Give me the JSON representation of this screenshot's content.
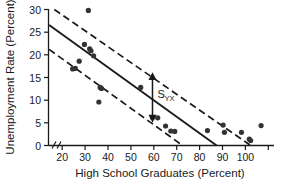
{
  "chart_data": {
    "type": "scatter",
    "title": "",
    "xlabel": "High School Graduates (Percent)",
    "ylabel": "Unemployment Rate (Percent)",
    "xlim": [
      15,
      100
    ],
    "ylim": [
      0,
      30
    ],
    "xticks": [
      20,
      30,
      40,
      50,
      60,
      70,
      80,
      90,
      100
    ],
    "yticks": [
      0,
      5,
      10,
      15,
      20,
      25,
      30
    ],
    "grid": false,
    "legend": null,
    "axis_break": true,
    "points": [
      {
        "x": 24.0,
        "y": 16.9
      },
      {
        "x": 25.0,
        "y": 17.0
      },
      {
        "x": 26.5,
        "y": 18.6
      },
      {
        "x": 28.5,
        "y": 22.3
      },
      {
        "x": 30.0,
        "y": 29.8
      },
      {
        "x": 30.5,
        "y": 21.3
      },
      {
        "x": 31.0,
        "y": 20.9
      },
      {
        "x": 32.0,
        "y": 19.8
      },
      {
        "x": 34.0,
        "y": 9.6
      },
      {
        "x": 34.5,
        "y": 12.8
      },
      {
        "x": 35.0,
        "y": 12.6
      },
      {
        "x": 50.0,
        "y": 12.8
      },
      {
        "x": 54.5,
        "y": 6.2
      },
      {
        "x": 56.5,
        "y": 6.1
      },
      {
        "x": 59.5,
        "y": 4.3
      },
      {
        "x": 61.5,
        "y": 3.2
      },
      {
        "x": 63.0,
        "y": 3.1
      },
      {
        "x": 75.5,
        "y": 3.3
      },
      {
        "x": 81.5,
        "y": 4.5
      },
      {
        "x": 82.0,
        "y": 2.9
      },
      {
        "x": 88.5,
        "y": 2.9
      },
      {
        "x": 91.5,
        "y": 1.4
      },
      {
        "x": 92.0,
        "y": 1.1
      },
      {
        "x": 96.0,
        "y": 4.4
      }
    ],
    "lines": [
      {
        "name": "regression-line",
        "style": "solid",
        "points": [
          [
            15,
            26.6
          ],
          [
            79,
            0
          ]
        ]
      },
      {
        "name": "upper-band-line",
        "style": "dashed",
        "points": [
          [
            17,
            30
          ],
          [
            92,
            0
          ]
        ]
      },
      {
        "name": "lower-band-line",
        "style": "dashed",
        "points": [
          [
            15,
            21.2
          ],
          [
            66,
            0
          ]
        ]
      }
    ],
    "annotations": [
      {
        "name": "syx-annotation",
        "label_main": "S",
        "label_sub": "YX",
        "type": "double-arrow",
        "x": 54.5,
        "y_top": 15.8,
        "y_bottom": 5.4
      }
    ],
    "colors": {
      "axis": "#1a1a1a",
      "point": "#333333",
      "line": "#1a1a1a",
      "background": "#ffffff"
    }
  }
}
